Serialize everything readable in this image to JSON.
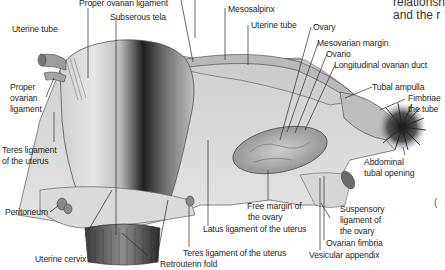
{
  "figure": {
    "caption_fragment": [
      "relationsh",
      "and the r"
    ],
    "side_fragment": "("
  },
  "labels": {
    "proper_ovarian_ligament_top": "Proper ovarian ligament",
    "subserous_tela": "Subserous tela",
    "mesosalpinx": "Mesosalpinx",
    "uterine_tube_top": "Uterine tube",
    "ovary": "Ovary",
    "mesovarian_margin": "Mesovarian margin",
    "ovario": "Ovario",
    "longitudinal_ovarian_duct": "Longitudinal ovarian duct",
    "tubal_ampulla": "Tubal ampulla",
    "fimbriae_line1": "Fimbriae",
    "fimbriae_line2": "the tube",
    "abdominal_tubal_opening_line1": "Abdominal",
    "abdominal_tubal_opening_line2": "tubal opening",
    "uterine_tube_left": "Uterine tube",
    "proper_ovarian_ligament_left_line1": "Proper",
    "proper_ovarian_ligament_left_line2": "ovarian",
    "proper_ovarian_ligament_left_line3": "ligament",
    "teres_ligament_left_line1": "Teres ligament",
    "teres_ligament_left_line2": "of the uterus",
    "peritoneum": "Peritoneum",
    "uterine_cervix": "Uterine cervix",
    "retrouterin_fold": "Retrouterin fold",
    "teres_ligament_bottom": "Teres ligament of the uterus",
    "latus_ligament": "Latus ligament of the uterus",
    "free_margin_line1": "Free margin of",
    "free_margin_line2": "the ovary",
    "suspensory_line1": "Suspensory",
    "suspensory_line2": "ligament of",
    "suspensory_line3": "the ovary",
    "ovarian_fimbria": "Ovarian fimbria",
    "vesicular_appendix": "Vesicular appendix"
  },
  "colors": {
    "background": "#ffffff",
    "text": "#231f20",
    "leader_line": "#2a2a2a",
    "tissue_light": "#d9d9d9",
    "tissue_mid": "#a8a8a8",
    "tissue_dark": "#2b2b2b"
  }
}
